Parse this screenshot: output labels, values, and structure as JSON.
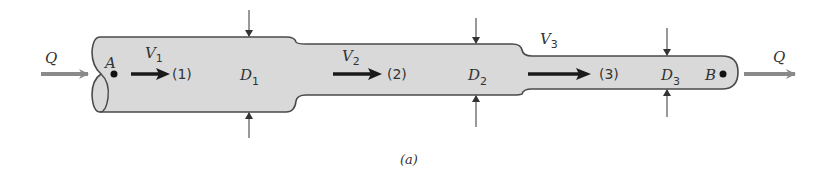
{
  "figure": {
    "caption": "(a)",
    "colors": {
      "pipe_fill": "#d9d9d9",
      "pipe_stroke": "#4a4a4a",
      "flow_arrow": "#8a8a8a",
      "velocity_arrow": "#1a1a1a",
      "text": "#333333"
    },
    "flow_in": {
      "label": "Q"
    },
    "flow_out": {
      "label": "Q"
    },
    "points": [
      {
        "name": "A"
      },
      {
        "name": "B"
      }
    ],
    "sections": [
      {
        "velocity_main": "V",
        "velocity_sub": "1",
        "station": "(1)",
        "diameter_main": "D",
        "diameter_sub": "1"
      },
      {
        "velocity_main": "V",
        "velocity_sub": "2",
        "station": "(2)",
        "diameter_main": "D",
        "diameter_sub": "2"
      },
      {
        "velocity_main": "V",
        "velocity_sub": "3",
        "station": "(3)",
        "diameter_main": "D",
        "diameter_sub": "3"
      }
    ]
  }
}
